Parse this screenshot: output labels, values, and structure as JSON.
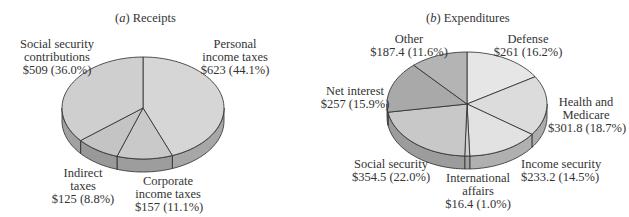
{
  "chart_data": [
    {
      "type": "pie",
      "title": "(a) Receipts",
      "panel": "a",
      "panel_title": "Receipts",
      "style": "3d",
      "slices": [
        {
          "label": "Personal income taxes",
          "line1": "Personal",
          "line2": "income taxes",
          "value": 623,
          "value_label": "$623 (44.1%)",
          "percent": 44.1,
          "color": "#d6d6d6"
        },
        {
          "label": "Corporate income taxes",
          "line1": "Corporate",
          "line2": "income taxes",
          "value": 157,
          "value_label": "$157 (11.1%)",
          "percent": 11.1,
          "color": "#c9c9c9"
        },
        {
          "label": "Indirect taxes",
          "line1": "Indirect",
          "line2": "taxes",
          "value": 125,
          "value_label": "$125 (8.8%)",
          "percent": 8.8,
          "color": "#c4c4c4"
        },
        {
          "label": "Social security contributions",
          "line1": "Social security",
          "line2": "contributions",
          "value": 509,
          "value_label": "$509 (36.0%)",
          "percent": 36.0,
          "color": "#cfcfcf"
        }
      ]
    },
    {
      "type": "pie",
      "title": "(b) Expenditures",
      "panel": "b",
      "panel_title": "Expenditures",
      "style": "3d",
      "slices": [
        {
          "label": "Defense",
          "line1": "Defense",
          "value": 261,
          "value_label": "$261 (16.2%)",
          "percent": 16.2,
          "color": "#e6e6e6"
        },
        {
          "label": "Health and Medicare",
          "line1": "Health and",
          "line2": "Medicare",
          "value": 301.8,
          "value_label": "$301.8 (18.7%)",
          "percent": 18.7,
          "color": "#dcdcdc"
        },
        {
          "label": "Income security",
          "line1": "Income security",
          "value": 233.2,
          "value_label": "$233.2 (14.5%)",
          "percent": 14.5,
          "color": "#e2e2e2"
        },
        {
          "label": "International affairs",
          "line1": "International",
          "line2": "affairs",
          "value": 16.4,
          "value_label": "$16.4 (1.0%)",
          "percent": 1.0,
          "color": "#d0d0d0"
        },
        {
          "label": "Social security",
          "line1": "Social security",
          "value": 354.5,
          "value_label": "$354.5 (22.0%)",
          "percent": 22.0,
          "color": "#c8c8c8"
        },
        {
          "label": "Net interest",
          "line1": "Net interest",
          "value": 257,
          "value_label": "$257 (15.9%)",
          "percent": 15.9,
          "color": "#a9a9a9"
        },
        {
          "label": "Other",
          "line1": "Other",
          "value": 187.4,
          "value_label": "$187.4 (11.6%)",
          "percent": 11.6,
          "color": "#b4b4b4"
        }
      ]
    }
  ]
}
